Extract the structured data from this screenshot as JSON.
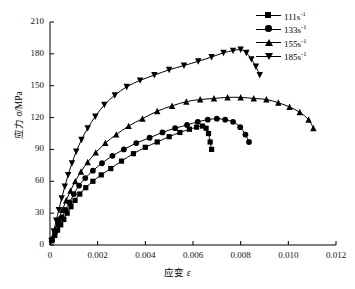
{
  "chart_data": {
    "type": "line",
    "title": "",
    "xlabel": "应变 ε",
    "ylabel": "应力 σ/MPa",
    "xlim": [
      0,
      0.012
    ],
    "ylim": [
      0,
      210
    ],
    "xticks": [
      "0",
      "0.002",
      "0.004",
      "0.006",
      "0.008",
      "0.010",
      "0.012"
    ],
    "xtick_values": [
      0,
      0.002,
      0.004,
      0.006,
      0.008,
      0.01,
      0.012
    ],
    "yticks": [
      "0",
      "30",
      "60",
      "90",
      "120",
      "150",
      "180",
      "210"
    ],
    "ytick_values": [
      0,
      30,
      60,
      90,
      120,
      150,
      180,
      210
    ],
    "grid": false,
    "legend_position": "upper-right",
    "series": [
      {
        "name": "111s-1",
        "label": "111s",
        "exponent": "-1",
        "marker": "square",
        "color": "#000000",
        "x": [
          8e-05,
          0.0002,
          0.00032,
          0.00045,
          0.00058,
          0.00072,
          0.00088,
          0.00105,
          0.00125,
          0.0015,
          0.0018,
          0.00215,
          0.00255,
          0.003,
          0.0035,
          0.004,
          0.0045,
          0.005,
          0.00545,
          0.00585,
          0.00615,
          0.0064,
          0.00655,
          0.00665,
          0.00672,
          0.00678
        ],
        "y": [
          4,
          9,
          14,
          19,
          24,
          30,
          36,
          42,
          48,
          54,
          60,
          66,
          72,
          79,
          86,
          92,
          97,
          102,
          106,
          109,
          111,
          112,
          110,
          105,
          97,
          90
        ]
      },
      {
        "name": "133s-1",
        "label": "133s",
        "exponent": "-1",
        "marker": "circle",
        "color": "#000000",
        "x": [
          8e-05,
          0.00022,
          0.00036,
          0.0005,
          0.00065,
          0.00082,
          0.001,
          0.00122,
          0.00148,
          0.0018,
          0.00218,
          0.00262,
          0.0031,
          0.00362,
          0.00418,
          0.00472,
          0.00525,
          0.00575,
          0.0062,
          0.00662,
          0.007,
          0.00735,
          0.00768,
          0.00798,
          0.0082,
          0.00835
        ],
        "y": [
          5,
          12,
          19,
          26,
          33,
          40,
          48,
          56,
          63,
          70,
          77,
          84,
          90,
          96,
          101,
          106,
          110,
          113,
          116,
          118,
          119,
          118,
          116,
          111,
          104,
          97
        ]
      },
      {
        "name": "155s-1",
        "label": "155s",
        "exponent": "-1",
        "marker": "triangle-up",
        "color": "#000000",
        "x": [
          8e-05,
          0.00022,
          0.00036,
          0.00052,
          0.00068,
          0.00086,
          0.00106,
          0.0013,
          0.00158,
          0.00192,
          0.00232,
          0.00278,
          0.0033,
          0.00388,
          0.0045,
          0.00512,
          0.00572,
          0.0063,
          0.00688,
          0.00745,
          0.008,
          0.00855,
          0.00908,
          0.00958,
          0.01005,
          0.01048,
          0.01085,
          0.01105
        ],
        "y": [
          6,
          15,
          24,
          33,
          42,
          51,
          60,
          69,
          78,
          87,
          96,
          104,
          112,
          119,
          126,
          131,
          135,
          137,
          138,
          139,
          139,
          138,
          137,
          134,
          130,
          125,
          118,
          110
        ]
      },
      {
        "name": "185s-1",
        "label": "185s",
        "exponent": "-1",
        "marker": "triangle-down",
        "color": "#000000",
        "x": [
          6e-05,
          0.00016,
          0.00026,
          0.00037,
          0.00049,
          0.00062,
          0.00076,
          0.00092,
          0.0011,
          0.00132,
          0.00158,
          0.0019,
          0.00228,
          0.00272,
          0.00322,
          0.00378,
          0.00438,
          0.005,
          0.00562,
          0.00622,
          0.00678,
          0.00728,
          0.00768,
          0.008,
          0.00824,
          0.00845,
          0.00864,
          0.0088
        ],
        "y": [
          4,
          13,
          23,
          33,
          44,
          55,
          66,
          77,
          88,
          99,
          110,
          121,
          132,
          141,
          149,
          155,
          160,
          165,
          169,
          173,
          177,
          181,
          183,
          184,
          181,
          175,
          168,
          160
        ]
      }
    ]
  },
  "legend": {
    "items": [
      {
        "label": "111s",
        "exponent": "-1",
        "marker": "square"
      },
      {
        "label": "133s",
        "exponent": "-1",
        "marker": "circle"
      },
      {
        "label": "155s",
        "exponent": "-1",
        "marker": "triangle-up"
      },
      {
        "label": "185s",
        "exponent": "-1",
        "marker": "triangle-down"
      }
    ]
  }
}
